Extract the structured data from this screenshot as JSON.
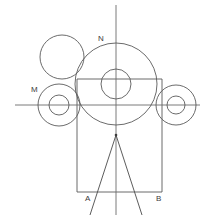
{
  "figure": {
    "canvas": {
      "width": 208,
      "height": 220,
      "background": "#ffffff"
    },
    "stroke_color": "#5a5a5a",
    "label_color": "#3c3c3c",
    "labels": [
      {
        "id": "N",
        "text": "N",
        "x": 98,
        "y": 35,
        "describes": "center-axis-upper-label"
      },
      {
        "id": "M",
        "text": "M",
        "x": 31,
        "y": 86,
        "describes": "left-wheel-upper-label"
      },
      {
        "id": "A",
        "text": "A",
        "x": 85,
        "y": 195,
        "describes": "left-base-corner-label"
      },
      {
        "id": "B",
        "text": "B",
        "x": 156,
        "y": 195,
        "describes": "right-base-corner-label"
      }
    ],
    "axes": {
      "vertical": {
        "x": 116,
        "y1": 5,
        "y2": 215
      },
      "horizontal": {
        "y": 105,
        "x1": 15,
        "x2": 200
      }
    },
    "circles": [
      {
        "id": "center-large",
        "cx": 116,
        "cy": 84,
        "r": 41,
        "role": "main-large-circle"
      },
      {
        "id": "center-hub",
        "cx": 116,
        "cy": 84,
        "r": 15,
        "role": "main-hub-circle"
      },
      {
        "id": "upper-left",
        "cx": 62,
        "cy": 57,
        "r": 22,
        "role": "upper-left-circle"
      },
      {
        "id": "left-wheel-outer",
        "cx": 59,
        "cy": 105,
        "r": 21,
        "role": "left-wheel-outer"
      },
      {
        "id": "left-wheel-inner",
        "cx": 59,
        "cy": 105,
        "r": 10,
        "role": "left-wheel-hub"
      },
      {
        "id": "right-wheel-outer",
        "cx": 176,
        "cy": 105,
        "r": 20,
        "role": "right-wheel-outer"
      },
      {
        "id": "right-wheel-inner",
        "cx": 176,
        "cy": 105,
        "r": 9,
        "role": "right-wheel-hub"
      }
    ],
    "rectangle": {
      "x": 77,
      "y": 79,
      "width": 85,
      "height": 113,
      "role": "body-frame"
    },
    "vee": {
      "apex_x": 116,
      "apex_y": 135,
      "left_x": 90,
      "left_y": 215,
      "right_x": 142,
      "right_y": 215,
      "role": "pendulum-v-lines"
    }
  }
}
